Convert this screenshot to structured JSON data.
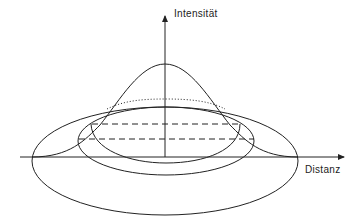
{
  "diagram": {
    "y_axis_label": "Intensität",
    "x_axis_label": "Distanz",
    "stroke_color": "#222222",
    "background": "#ffffff"
  }
}
